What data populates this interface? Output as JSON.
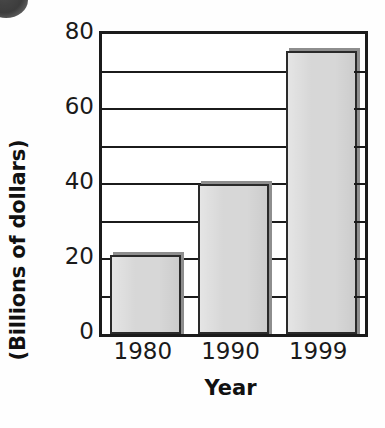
{
  "chart_data": {
    "type": "bar",
    "title": "",
    "subtitle": "",
    "xlabel": "Year",
    "ylabel": "(Billions of dollars)",
    "categories": [
      "1980",
      "1990",
      "1999"
    ],
    "values": [
      21,
      40,
      75.5
    ],
    "series": [
      {
        "name": "",
        "values": [
          21,
          40,
          75.5
        ]
      }
    ],
    "ylim": [
      0,
      80
    ],
    "ytick_labels": [
      "0",
      "20",
      "40",
      "60",
      "80"
    ],
    "ytick_values": [
      0,
      20,
      40,
      60,
      80
    ],
    "gridline_values": [
      10,
      20,
      30,
      40,
      50,
      60,
      70
    ],
    "grid": true,
    "legend": null,
    "legend_position": "none",
    "annotations": [],
    "bar_fill_color": "#d7d7d7",
    "bar_edge_color": "#2a2a2a",
    "bar_shadow_color": "#8e8e8e",
    "axis_color": "#1b1b1b",
    "background_color": "#ffffff"
  },
  "decoration": {
    "corner_bullet": "filled-circle-marker"
  }
}
